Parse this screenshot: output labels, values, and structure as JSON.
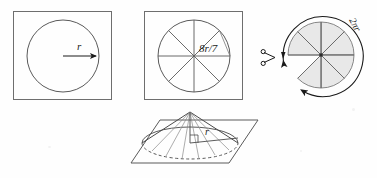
{
  "figure": {
    "background_color": "#fefefe",
    "stroke_color": "#4a4a4a",
    "dark_stroke_color": "#1a1a1a",
    "shade_color": "#e8e8e8",
    "panels": [
      {
        "id": "panel-square-circle",
        "name": "square-with-inscribed-circle",
        "label": "r",
        "label_meaning": "radius",
        "description": "Square frame containing a circle with a radius arrow pointing right"
      },
      {
        "id": "panel-sectors",
        "name": "square-with-sectored-circle",
        "label": "8r/7",
        "label_meaning": "eight r over seven",
        "sector_count": 8,
        "description": "Square frame containing a circle divided into eight equal sectors"
      },
      {
        "id": "panel-cut-disc",
        "name": "shaded-disc-with-removed-sector",
        "label": "2πr",
        "label_meaning": "circumference two pi r",
        "sector_count": 8,
        "removed_sectors": 1,
        "icons": [
          "scissors-icon",
          "arrow-head-icon"
        ],
        "description": "Shaded disc of eight sectors with one wedge removed, wrapped by a double headed arc arrow and a scissors mark"
      },
      {
        "id": "panel-cone",
        "name": "cone-on-plane",
        "label": "r",
        "label_meaning": "base radius",
        "description": "Cone standing on a parallelogram plane with radius segment and right angle mark"
      }
    ],
    "labels": {
      "radius": "r",
      "sector_arc": "8r/7",
      "circumference": "2πr",
      "cone_radius": "r"
    }
  }
}
